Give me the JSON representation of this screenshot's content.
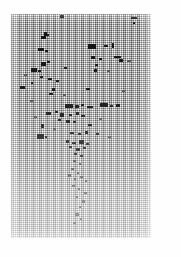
{
  "document": {
    "kind": "degraded-halftone-scan",
    "legible_text": "",
    "note_visible_on_page": "",
    "page_background": "#fefefe",
    "block_background": "#c8c8c8",
    "ink_color": "#111111"
  },
  "scan_block": {
    "x": 11,
    "y": 14,
    "width": 140,
    "height": 224
  },
  "texture": {
    "type": "crosshatch-halftone",
    "scanline_period_px": 2,
    "dither_column_period_px": 2
  },
  "ink_marks": [
    {
      "x": 60,
      "y": 15,
      "w": 4,
      "h": 3
    },
    {
      "x": 131,
      "y": 17,
      "w": 6,
      "h": 2
    },
    {
      "x": 133,
      "y": 22,
      "w": 2,
      "h": 2
    },
    {
      "x": 44,
      "y": 32,
      "w": 3,
      "h": 4
    },
    {
      "x": 41,
      "y": 36,
      "w": 5,
      "h": 3
    },
    {
      "x": 47,
      "y": 34,
      "w": 2,
      "h": 2
    },
    {
      "x": 88,
      "y": 44,
      "w": 8,
      "h": 5
    },
    {
      "x": 104,
      "y": 45,
      "w": 4,
      "h": 2
    },
    {
      "x": 112,
      "y": 43,
      "w": 2,
      "h": 5
    },
    {
      "x": 38,
      "y": 48,
      "w": 6,
      "h": 3
    },
    {
      "x": 45,
      "y": 50,
      "w": 3,
      "h": 2
    },
    {
      "x": 91,
      "y": 56,
      "w": 4,
      "h": 3
    },
    {
      "x": 99,
      "y": 58,
      "w": 3,
      "h": 2
    },
    {
      "x": 114,
      "y": 56,
      "w": 7,
      "h": 2
    },
    {
      "x": 119,
      "y": 59,
      "w": 4,
      "h": 3
    },
    {
      "x": 41,
      "y": 62,
      "w": 5,
      "h": 4
    },
    {
      "x": 47,
      "y": 61,
      "w": 3,
      "h": 2
    },
    {
      "x": 95,
      "y": 64,
      "w": 3,
      "h": 2
    },
    {
      "x": 31,
      "y": 68,
      "w": 6,
      "h": 4
    },
    {
      "x": 38,
      "y": 70,
      "w": 3,
      "h": 2
    },
    {
      "x": 64,
      "y": 67,
      "w": 3,
      "h": 2
    },
    {
      "x": 94,
      "y": 69,
      "w": 3,
      "h": 3
    },
    {
      "x": 40,
      "y": 76,
      "w": 3,
      "h": 2
    },
    {
      "x": 48,
      "y": 78,
      "w": 4,
      "h": 2
    },
    {
      "x": 56,
      "y": 80,
      "w": 3,
      "h": 2
    },
    {
      "x": 31,
      "y": 82,
      "w": 2,
      "h": 2
    },
    {
      "x": 20,
      "y": 86,
      "w": 5,
      "h": 3
    },
    {
      "x": 52,
      "y": 88,
      "w": 3,
      "h": 3
    },
    {
      "x": 49,
      "y": 93,
      "w": 4,
      "h": 2
    },
    {
      "x": 86,
      "y": 88,
      "w": 4,
      "h": 2
    },
    {
      "x": 65,
      "y": 104,
      "w": 8,
      "h": 4
    },
    {
      "x": 75,
      "y": 105,
      "w": 4,
      "h": 3
    },
    {
      "x": 81,
      "y": 104,
      "w": 3,
      "h": 2
    },
    {
      "x": 87,
      "y": 106,
      "w": 6,
      "h": 2
    },
    {
      "x": 100,
      "y": 103,
      "w": 8,
      "h": 4
    },
    {
      "x": 110,
      "y": 105,
      "w": 3,
      "h": 2
    },
    {
      "x": 116,
      "y": 104,
      "w": 4,
      "h": 3
    },
    {
      "x": 46,
      "y": 112,
      "w": 5,
      "h": 3
    },
    {
      "x": 55,
      "y": 111,
      "w": 3,
      "h": 2
    },
    {
      "x": 60,
      "y": 113,
      "w": 4,
      "h": 4
    },
    {
      "x": 69,
      "y": 114,
      "w": 3,
      "h": 2
    },
    {
      "x": 76,
      "y": 112,
      "w": 3,
      "h": 3
    },
    {
      "x": 81,
      "y": 115,
      "w": 4,
      "h": 2
    },
    {
      "x": 58,
      "y": 119,
      "w": 3,
      "h": 2
    },
    {
      "x": 66,
      "y": 120,
      "w": 4,
      "h": 3
    },
    {
      "x": 73,
      "y": 121,
      "w": 3,
      "h": 2
    },
    {
      "x": 41,
      "y": 124,
      "w": 3,
      "h": 4
    },
    {
      "x": 88,
      "y": 124,
      "w": 4,
      "h": 2
    },
    {
      "x": 37,
      "y": 134,
      "w": 7,
      "h": 5
    },
    {
      "x": 45,
      "y": 136,
      "w": 2,
      "h": 2
    },
    {
      "x": 70,
      "y": 132,
      "w": 4,
      "h": 2
    },
    {
      "x": 78,
      "y": 133,
      "w": 3,
      "h": 2
    },
    {
      "x": 85,
      "y": 131,
      "w": 3,
      "h": 3
    },
    {
      "x": 96,
      "y": 133,
      "w": 3,
      "h": 2
    },
    {
      "x": 66,
      "y": 140,
      "w": 3,
      "h": 3
    },
    {
      "x": 72,
      "y": 142,
      "w": 4,
      "h": 2
    },
    {
      "x": 79,
      "y": 140,
      "w": 5,
      "h": 4
    },
    {
      "x": 86,
      "y": 143,
      "w": 3,
      "h": 2
    },
    {
      "x": 69,
      "y": 146,
      "w": 3,
      "h": 2
    },
    {
      "x": 76,
      "y": 148,
      "w": 4,
      "h": 3
    },
    {
      "x": 83,
      "y": 147,
      "w": 3,
      "h": 2
    },
    {
      "x": 74,
      "y": 153,
      "w": 3,
      "h": 2
    },
    {
      "x": 80,
      "y": 155,
      "w": 3,
      "h": 2
    }
  ],
  "faint_marks": [
    {
      "x": 73,
      "y": 160,
      "w": 3,
      "h": 2
    },
    {
      "x": 79,
      "y": 163,
      "w": 2,
      "h": 2
    },
    {
      "x": 71,
      "y": 168,
      "w": 3,
      "h": 2
    },
    {
      "x": 77,
      "y": 172,
      "w": 2,
      "h": 2
    },
    {
      "x": 68,
      "y": 174,
      "w": 3,
      "h": 3
    },
    {
      "x": 74,
      "y": 178,
      "w": 2,
      "h": 2
    },
    {
      "x": 80,
      "y": 176,
      "w": 3,
      "h": 2
    },
    {
      "x": 85,
      "y": 180,
      "w": 2,
      "h": 2
    },
    {
      "x": 72,
      "y": 185,
      "w": 3,
      "h": 2
    },
    {
      "x": 78,
      "y": 188,
      "w": 2,
      "h": 2
    },
    {
      "x": 84,
      "y": 192,
      "w": 3,
      "h": 2
    },
    {
      "x": 76,
      "y": 196,
      "w": 2,
      "h": 2
    },
    {
      "x": 82,
      "y": 200,
      "w": 3,
      "h": 3
    },
    {
      "x": 79,
      "y": 206,
      "w": 2,
      "h": 2
    },
    {
      "x": 75,
      "y": 213,
      "w": 4,
      "h": 3
    },
    {
      "x": 80,
      "y": 218,
      "w": 2,
      "h": 2
    },
    {
      "x": 73,
      "y": 222,
      "w": 3,
      "h": 2
    }
  ],
  "soft_marks": [
    {
      "x": 30,
      "y": 100,
      "w": 3,
      "h": 2
    },
    {
      "x": 107,
      "y": 70,
      "w": 3,
      "h": 2
    },
    {
      "x": 122,
      "y": 90,
      "w": 3,
      "h": 2
    },
    {
      "x": 99,
      "y": 118,
      "w": 3,
      "h": 2
    },
    {
      "x": 53,
      "y": 128,
      "w": 3,
      "h": 2
    },
    {
      "x": 108,
      "y": 136,
      "w": 3,
      "h": 2
    },
    {
      "x": 34,
      "y": 116,
      "w": 3,
      "h": 2
    },
    {
      "x": 63,
      "y": 94,
      "w": 3,
      "h": 2
    },
    {
      "x": 127,
      "y": 60,
      "w": 4,
      "h": 2
    },
    {
      "x": 24,
      "y": 74,
      "w": 3,
      "h": 2
    }
  ]
}
